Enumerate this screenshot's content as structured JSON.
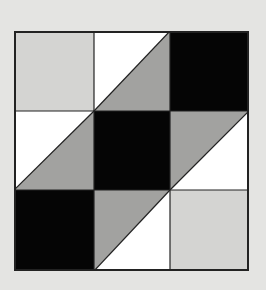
{
  "diagram": {
    "type": "nine-patch-quilt-block",
    "grid": {
      "rows": 3,
      "cols": 3
    },
    "colors": {
      "background": "#e4e4e2",
      "light_gray": "#d4d4d2",
      "medium_gray": "#a2a2a0",
      "black": "#050505",
      "white": "#ffffff",
      "line": "#222222"
    },
    "cells": [
      {
        "row": 0,
        "col": 0,
        "kind": "solid",
        "fill": "light_gray"
      },
      {
        "row": 0,
        "col": 1,
        "kind": "half-square",
        "diagonal": "bl-tr",
        "upper_left": "white",
        "lower_right": "medium_gray"
      },
      {
        "row": 0,
        "col": 2,
        "kind": "solid",
        "fill": "black"
      },
      {
        "row": 1,
        "col": 0,
        "kind": "half-square",
        "diagonal": "bl-tr",
        "upper_left": "white",
        "lower_right": "medium_gray"
      },
      {
        "row": 1,
        "col": 1,
        "kind": "solid",
        "fill": "black"
      },
      {
        "row": 1,
        "col": 2,
        "kind": "half-square",
        "diagonal": "bl-tr",
        "upper_left": "medium_gray",
        "lower_right": "white"
      },
      {
        "row": 2,
        "col": 0,
        "kind": "solid",
        "fill": "black"
      },
      {
        "row": 2,
        "col": 1,
        "kind": "half-square",
        "diagonal": "bl-tr",
        "upper_left": "medium_gray",
        "lower_right": "white"
      },
      {
        "row": 2,
        "col": 2,
        "kind": "solid",
        "fill": "light_gray"
      }
    ]
  }
}
